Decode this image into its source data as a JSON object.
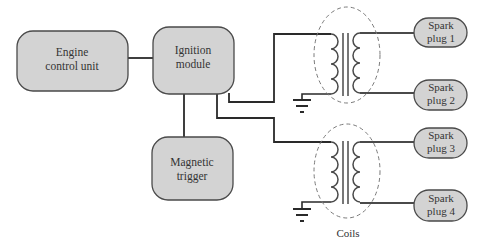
{
  "diagram": {
    "colors": {
      "box_fill": "#d3d3d3",
      "box_stroke": "#4a4a4a",
      "wire": "#2a2a2a",
      "coil": "#4a4a4a",
      "dashed_ellipse": "#7a7a7a",
      "text": "#333333"
    },
    "blocks": {
      "ecu": {
        "line1": "Engine",
        "line2": "control unit"
      },
      "ignition_module": {
        "line1": "Ignition",
        "line2": "module"
      },
      "magnetic_trigger": {
        "line1": "Magnetic",
        "line2": "trigger"
      }
    },
    "spark_plugs": [
      {
        "line1": "Spark",
        "line2": "plug 1"
      },
      {
        "line1": "Spark",
        "line2": "plug 2"
      },
      {
        "line1": "Spark",
        "line2": "plug 3"
      },
      {
        "line1": "Spark",
        "line2": "plug 4"
      }
    ],
    "coils_label": "Coils"
  }
}
